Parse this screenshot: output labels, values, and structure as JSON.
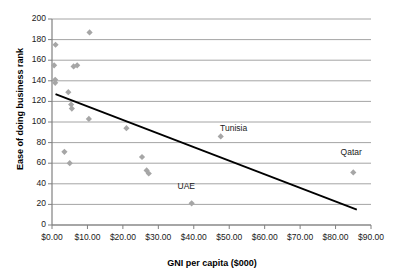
{
  "chart_data": {
    "type": "scatter",
    "title": "",
    "xlabel": "GNI per capita ($000)",
    "ylabel": "Ease of doing business rank",
    "xlim": [
      0,
      90
    ],
    "ylim": [
      0,
      200
    ],
    "xtick_step": 10,
    "ytick_step": 20,
    "xticks": [
      "$0.00",
      "$10.00",
      "$20.00",
      "$30.00",
      "$40.00",
      "$50.00",
      "$60.00",
      "$70.00",
      "$80.00",
      "$90.00"
    ],
    "yticks": [
      "0",
      "20",
      "40",
      "60",
      "80",
      "100",
      "120",
      "140",
      "160",
      "180",
      "200"
    ],
    "grid": "horizontal",
    "legend": "none",
    "marker_color": "#a6a6a6",
    "trendline_color": "#000000",
    "axis_color": "#808080",
    "points": [
      {
        "x": 1.0,
        "y": 175
      },
      {
        "x": 0.6,
        "y": 155
      },
      {
        "x": 0.9,
        "y": 141
      },
      {
        "x": 0.9,
        "y": 138
      },
      {
        "x": 4.6,
        "y": 129
      },
      {
        "x": 6.1,
        "y": 154
      },
      {
        "x": 7.1,
        "y": 155
      },
      {
        "x": 5.4,
        "y": 117
      },
      {
        "x": 5.6,
        "y": 113
      },
      {
        "x": 10.6,
        "y": 187
      },
      {
        "x": 10.4,
        "y": 103
      },
      {
        "x": 3.5,
        "y": 71
      },
      {
        "x": 5.0,
        "y": 60
      },
      {
        "x": 21.0,
        "y": 94
      },
      {
        "x": 25.4,
        "y": 66
      },
      {
        "x": 26.7,
        "y": 53
      },
      {
        "x": 27.3,
        "y": 50
      },
      {
        "x": 39.4,
        "y": 21,
        "label": "UAE"
      },
      {
        "x": 47.6,
        "y": 86,
        "label": "Tunisia"
      },
      {
        "x": 85.0,
        "y": 51,
        "label": "Qatar"
      }
    ],
    "annotations": [
      {
        "text": "Tunisia",
        "x": 52.5,
        "y": 93
      },
      {
        "text": "Qatar",
        "x": 86.5,
        "y": 70
      },
      {
        "text": "UAE",
        "x": 40.5,
        "y": 37
      }
    ],
    "trendline": {
      "x0": 1.0,
      "y0": 127,
      "x1": 86.0,
      "y1": 15
    }
  }
}
